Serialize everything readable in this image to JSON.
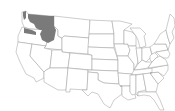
{
  "map": {
    "type": "choropleth",
    "region": "Contiguous United States",
    "boundaries": "state",
    "colors": {
      "background": "#ffffff",
      "state_fill": "#ffffff",
      "border": "#9a9a9a",
      "highlight": "#7a7a7a"
    },
    "highlighted_regions": [
      {
        "name": "Eastern Washington",
        "state": "WA"
      },
      {
        "name": "Northern Oregon",
        "state": "OR"
      },
      {
        "name": "Idaho Panhandle",
        "state": "ID"
      }
    ]
  }
}
